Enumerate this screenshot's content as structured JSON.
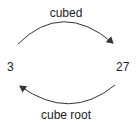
{
  "diagram": {
    "nodes": [
      {
        "id": "left",
        "label": "3"
      },
      {
        "id": "right",
        "label": "27"
      }
    ],
    "edges": [
      {
        "from": "left",
        "to": "right",
        "label": "cubed",
        "position": "top"
      },
      {
        "from": "right",
        "to": "left",
        "label": "cube root",
        "position": "bottom"
      }
    ],
    "colors": {
      "stroke": "#333333",
      "text": "#222222",
      "background": "#ffffff"
    }
  }
}
